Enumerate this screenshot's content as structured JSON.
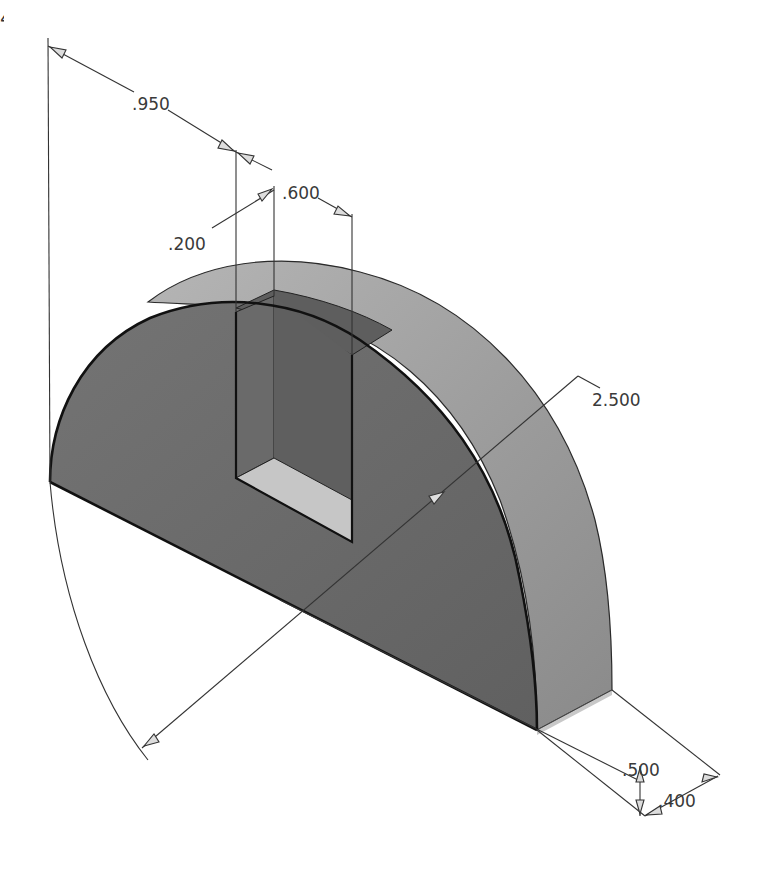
{
  "figure": {
    "number_fragment": "4"
  },
  "colors": {
    "background": "#ffffff",
    "front_face": "#6d6d6d",
    "curved_face": "#a9a9a9",
    "slot_inner_dark": "#5f5f5f",
    "slot_floor_light": "#c4c4c4",
    "edge": "#1a1a1a",
    "dim_line": "#333333"
  },
  "dimensions": {
    "slot_offset": ".950",
    "slot_width": ".600",
    "slot_depth_offset": ".200",
    "diameter": "2.500",
    "height": ".500",
    "thickness": ".400"
  }
}
